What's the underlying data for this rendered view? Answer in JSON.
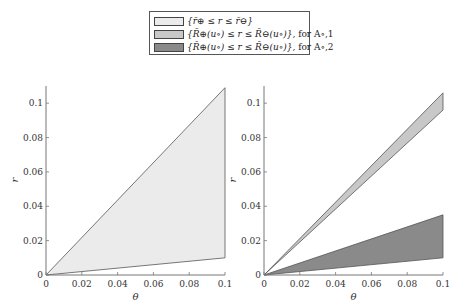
{
  "legend": {
    "items": [
      {
        "label": "{r̄⊕ ≤ r ≤ r̄⊖}",
        "color": "#ebebeb"
      },
      {
        "label": "{R̄⊕(u∘) ≤ r ≤ R̄⊖(u∘)},",
        "suffix": "for A∘,1",
        "color": "#c8c8c8"
      },
      {
        "label": "{R̄⊕(u∘) ≤ r ≤ R̄⊖(u∘)},",
        "suffix": "for A∘,2",
        "color": "#8a8a8a"
      }
    ]
  },
  "chart_data": [
    {
      "type": "area",
      "title": "",
      "xlabel": "θ",
      "ylabel": "r",
      "xlim": [
        0,
        0.1
      ],
      "ylim": [
        0,
        0.11
      ],
      "xticks": [
        "0",
        "0.02",
        "0.04",
        "0.06",
        "0.08",
        "0.1"
      ],
      "yticks": [
        "0",
        "0.02",
        "0.04",
        "0.06",
        "0.08",
        "0.1"
      ],
      "grid": false,
      "series": [
        {
          "name": "{r̄⊕ ≤ r ≤ r̄⊖}",
          "x": [
            0,
            0.1
          ],
          "lower": [
            0,
            0.01
          ],
          "upper": [
            0,
            0.109
          ],
          "color": "#ebebeb"
        }
      ]
    },
    {
      "type": "area",
      "title": "",
      "xlabel": "θ",
      "ylabel": "r",
      "xlim": [
        0,
        0.1
      ],
      "ylim": [
        0,
        0.11
      ],
      "xticks": [
        "0",
        "0.02",
        "0.04",
        "0.06",
        "0.08",
        "0.1"
      ],
      "yticks": [
        "0",
        "0.02",
        "0.04",
        "0.06",
        "0.08",
        "0.1"
      ],
      "grid": false,
      "series": [
        {
          "name": "{R̄⊕(u∘) ≤ r ≤ R̄⊖(u∘)}, for A∘,1",
          "x": [
            0,
            0.1
          ],
          "lower": [
            0,
            0.096
          ],
          "upper": [
            0,
            0.106
          ],
          "color": "#c8c8c8"
        },
        {
          "name": "{R̄⊕(u∘) ≤ r ≤ R̄⊖(u∘)}, for A∘,2",
          "x": [
            0,
            0.1
          ],
          "lower": [
            0,
            0.01
          ],
          "upper": [
            0,
            0.035
          ],
          "color": "#8a8a8a"
        }
      ]
    }
  ]
}
